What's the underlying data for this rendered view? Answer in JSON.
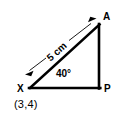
{
  "figure": {
    "background_color": "#ffffff",
    "stroke_color": "#000000",
    "vertices": [
      {
        "name": "X",
        "label": "X",
        "x": 30,
        "y": 88,
        "label_x": 17,
        "label_y": 84
      },
      {
        "name": "A",
        "label": "A",
        "x": 99,
        "y": 25,
        "label_x": 103,
        "label_y": 12
      },
      {
        "name": "P",
        "label": "P",
        "x": 99,
        "y": 88,
        "label_x": 104,
        "label_y": 84
      }
    ],
    "edges": [
      {
        "name": "base-XP",
        "from": "X",
        "to": "P",
        "x1": 30,
        "y1": 88,
        "x2": 100,
        "y2": 88,
        "width": 2.6
      },
      {
        "name": "vertical-AP",
        "from": "A",
        "to": "P",
        "x1": 99,
        "y1": 25,
        "x2": 99,
        "y2": 88,
        "width": 2.6
      },
      {
        "name": "hypotenuse-XA",
        "from": "X",
        "to": "A",
        "x1": 30,
        "y1": 88,
        "x2": 99,
        "y2": 25,
        "width": 2.6
      }
    ],
    "dimension": {
      "name": "hypotenuse-dimension",
      "label": "5 cm",
      "value": 5,
      "unit": "cm",
      "x1": 26,
      "y1": 73,
      "x2": 95,
      "y2": 20,
      "line_width": 0.8,
      "arrow_both_ends": true,
      "label_rotation_deg": -41.5,
      "label_center_x": 57,
      "label_center_y": 52
    },
    "angle": {
      "name": "angle-at-X",
      "label": "40°",
      "value": 40,
      "unit": "degrees",
      "at_vertex": "X",
      "label_x": 56,
      "label_y": 69
    },
    "coordinate": {
      "name": "coordinate-of-X",
      "label": "(3,4)",
      "belongs_to": "X",
      "x": 14,
      "y": 99
    }
  }
}
